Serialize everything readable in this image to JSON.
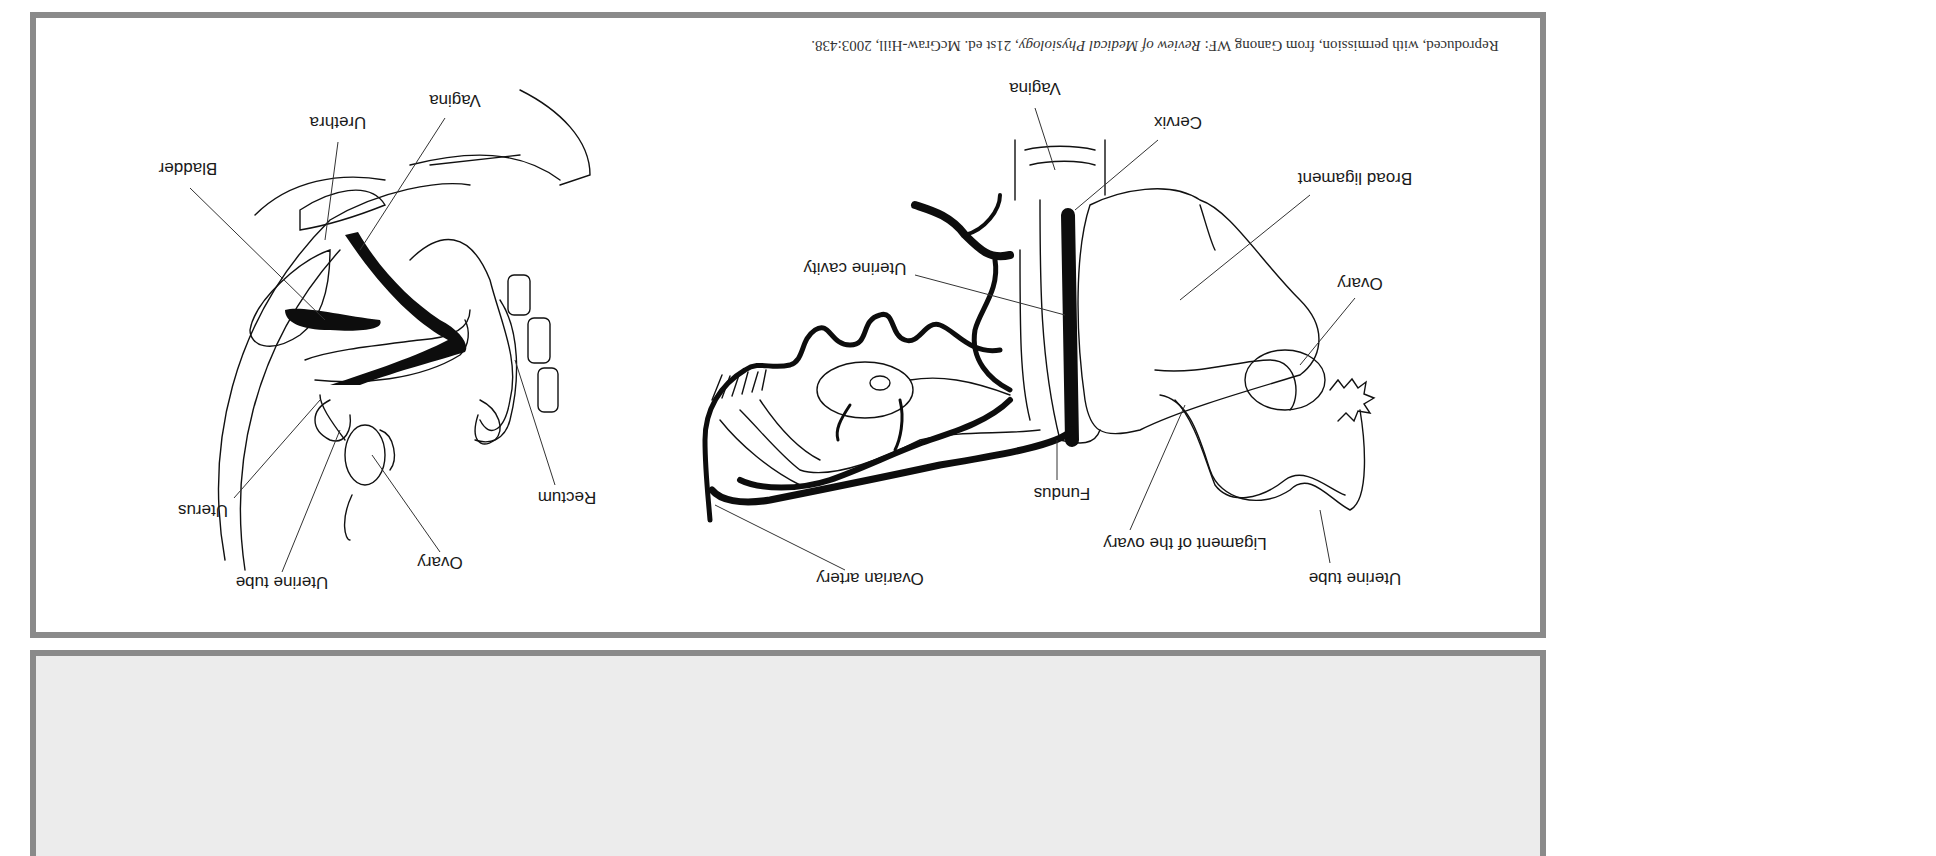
{
  "figure": {
    "orientation": "rotated 180 degrees",
    "credit": {
      "prefix": "Reproduced, with permission, from Ganong WF: ",
      "title": "Review of Medical Physiology",
      "suffix": ", 21st ed. McGraw-Hill, 2003:438."
    },
    "left_diagram": {
      "view": "sagittal section",
      "labels": {
        "bladder": "Bladder",
        "urethra": "Urethra",
        "vagina": "Vagina",
        "uterus": "Uterus",
        "uterine_tube": "Uterine tube",
        "ovary": "Ovary",
        "rectum": "Rectum"
      }
    },
    "right_diagram": {
      "view": "posterior view",
      "labels": {
        "vagina": "Vagina",
        "cervix": "Cervix",
        "broad_ligament": "Broad ligament",
        "uterine_cavity": "Uterine cavity",
        "ovary": "Ovary",
        "fundus": "Fundus",
        "ligament_of_ovary": "Ligament of the ovary",
        "ovarian_artery": "Ovarian artery",
        "uterine_tube": "Uterine tube"
      }
    },
    "colors": {
      "frame": "#8a8a8a",
      "ink": "#111111",
      "lower_panel": "#ececec"
    }
  }
}
